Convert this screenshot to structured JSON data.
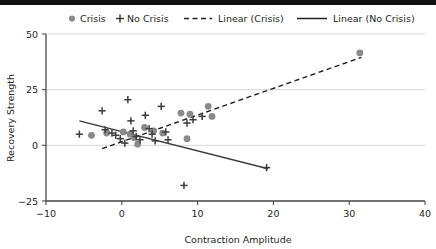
{
  "chart_data": {
    "type": "scatter",
    "title": "",
    "xlabel": "Contraction Amplitude",
    "ylabel": "Recovery Strength",
    "xlim": [
      -10,
      40
    ],
    "ylim": [
      -25,
      50
    ],
    "xticks": [
      -10,
      0,
      10,
      20,
      30,
      40
    ],
    "yticks": [
      -25,
      0,
      25,
      50
    ],
    "xtick_labels": [
      "-10",
      "0",
      "10",
      "20",
      "30",
      "40"
    ],
    "ytick_labels": [
      "-25",
      "0",
      "25",
      "50"
    ],
    "grid": "horizontal",
    "legend_position": "top",
    "series": [
      {
        "name": "Crisis",
        "marker": "circle",
        "color": "#8a8a8a",
        "points": [
          [
            -4.0,
            4.5
          ],
          [
            -2.0,
            5.5
          ],
          [
            0.2,
            6.0
          ],
          [
            1.1,
            5.0
          ],
          [
            1.6,
            3.5
          ],
          [
            2.1,
            0.5
          ],
          [
            3.0,
            8.0
          ],
          [
            4.2,
            6.5
          ],
          [
            5.4,
            5.5
          ],
          [
            7.8,
            14.5
          ],
          [
            8.6,
            3.0
          ],
          [
            9.0,
            14.0
          ],
          [
            11.4,
            17.5
          ],
          [
            11.9,
            13.0
          ],
          [
            31.4,
            41.5
          ]
        ]
      },
      {
        "name": "No Crisis",
        "marker": "plus",
        "color": "#3b3b3b",
        "points": [
          [
            -5.6,
            5.0
          ],
          [
            -2.6,
            15.5
          ],
          [
            -2.2,
            7.0
          ],
          [
            -1.3,
            5.5
          ],
          [
            -0.8,
            4.5
          ],
          [
            -0.2,
            3.0
          ],
          [
            0.4,
            1.0
          ],
          [
            0.8,
            20.5
          ],
          [
            1.2,
            11.0
          ],
          [
            1.5,
            6.5
          ],
          [
            1.9,
            4.0
          ],
          [
            2.4,
            2.5
          ],
          [
            3.1,
            13.5
          ],
          [
            3.6,
            7.5
          ],
          [
            4.0,
            5.0
          ],
          [
            4.4,
            2.0
          ],
          [
            5.2,
            17.5
          ],
          [
            5.8,
            6.0
          ],
          [
            6.1,
            2.5
          ],
          [
            8.2,
            -18.0
          ],
          [
            8.6,
            10.0
          ],
          [
            9.4,
            11.5
          ],
          [
            10.6,
            13.0
          ],
          [
            19.1,
            -10.0
          ]
        ]
      }
    ],
    "trendlines": [
      {
        "name": "Linear (Crisis)",
        "style": "dashed",
        "color": "#231f20",
        "x0": -2.6,
        "y0": -1.5,
        "x1": 31.6,
        "y1": 39.5
      },
      {
        "name": "Linear (No Crisis)",
        "style": "solid",
        "color": "#3b3b3b",
        "x0": -5.6,
        "y0": 11.0,
        "x1": 19.3,
        "y1": -10.5
      }
    ]
  },
  "legend": {
    "items": [
      {
        "label": "Crisis",
        "marker": "circle",
        "color": "#8a8a8a"
      },
      {
        "label": "No Crisis",
        "marker": "plus",
        "color": "#3b3b3b"
      },
      {
        "label": "Linear (Crisis)",
        "marker": "dashed-line",
        "color": "#231f20"
      },
      {
        "label": "Linear (No Crisis)",
        "marker": "solid-line",
        "color": "#231f20"
      }
    ]
  }
}
